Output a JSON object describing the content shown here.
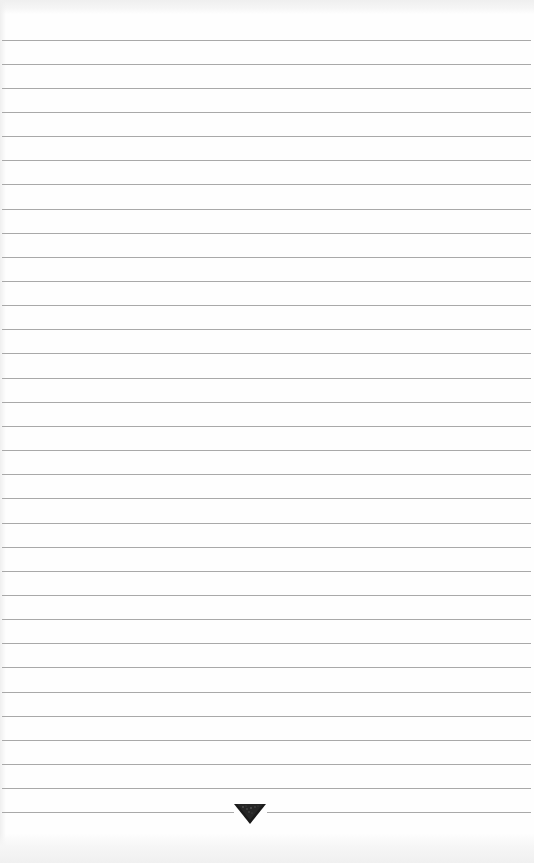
{
  "document": {
    "type": "ruled-notebook-page",
    "ruled_line_count": 33,
    "line_spacing_px": 24.15,
    "first_line_y": 39.5,
    "colors": {
      "paper": "#fefefe",
      "rule": "#a9a9a9",
      "ornament": "#1a1a1a"
    }
  },
  "footer": {
    "ornament_icon": "inverted-triangle-ornament"
  }
}
